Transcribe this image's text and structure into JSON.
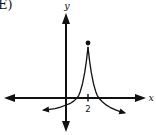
{
  "figure": {
    "label": "(E)"
  },
  "colors": {
    "ink": "#111111",
    "background": "#ffffff"
  },
  "chart_data": {
    "type": "line",
    "title": "",
    "xlabel": "x",
    "ylabel": "y",
    "grid": false,
    "axis_arrows": true,
    "x_ticks": [
      {
        "value": 2,
        "label": "2"
      }
    ],
    "y_ticks": [],
    "axes_px": {
      "origin": [
        66,
        98
      ],
      "unit": 11,
      "x_axis_left_tip": 4,
      "x_axis_right_tip": 146,
      "y_axis_top_tip": 13,
      "y_axis_bottom_tip": 132
    },
    "marked_point": {
      "x": 2,
      "y": 5,
      "style": "filled-dot"
    },
    "peak_cusp": {
      "x": 2,
      "y": 4.6
    },
    "x_intercepts_approx": [
      1,
      3
    ],
    "series": [
      {
        "name": "left-branch",
        "arrow_at_end": true,
        "points": [
          [
            2,
            4.6
          ],
          [
            1.85,
            3.3
          ],
          [
            1.7,
            2.3
          ],
          [
            1.5,
            1.3
          ],
          [
            1.3,
            0.6
          ],
          [
            1.15,
            0.22
          ],
          [
            1.0,
            0.0
          ],
          [
            0.7,
            -0.28
          ],
          [
            0.4,
            -0.48
          ],
          [
            0.0,
            -0.64
          ],
          [
            -0.5,
            -0.83
          ],
          [
            -1.0,
            -0.96
          ],
          [
            -1.5,
            -1.04
          ],
          [
            -2.0,
            -1.1
          ]
        ]
      },
      {
        "name": "right-branch",
        "arrow_at_end": true,
        "points": [
          [
            2,
            4.6
          ],
          [
            2.15,
            3.3
          ],
          [
            2.3,
            2.3
          ],
          [
            2.5,
            1.3
          ],
          [
            2.7,
            0.6
          ],
          [
            2.85,
            0.22
          ],
          [
            3.0,
            -0.02
          ],
          [
            3.3,
            -0.35
          ],
          [
            3.6,
            -0.6
          ],
          [
            4.0,
            -0.85
          ],
          [
            4.5,
            -1.08
          ],
          [
            5.0,
            -1.25
          ],
          [
            5.3,
            -1.34
          ]
        ]
      }
    ]
  }
}
